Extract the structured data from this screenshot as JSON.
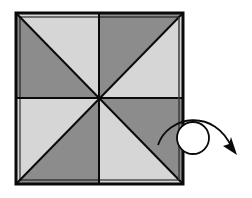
{
  "diagram": {
    "type": "origami-fold-diagram",
    "colors": {
      "background": "#ffffff",
      "light_panel": "#d6d6d6",
      "dark_panel": "#8c8c8c",
      "line": "#0a0a0a"
    },
    "square": {
      "x0": 16,
      "y0": 13,
      "x1": 183,
      "y1": 184,
      "cx": 99,
      "cy": 98
    },
    "triangles": [
      {
        "name": "top-left-lower",
        "shade": "dark"
      },
      {
        "name": "top-left-upper",
        "shade": "light"
      },
      {
        "name": "top-right-upper",
        "shade": "dark"
      },
      {
        "name": "top-right-lower",
        "shade": "light"
      },
      {
        "name": "bottom-left-upper",
        "shade": "light"
      },
      {
        "name": "bottom-left-lower",
        "shade": "dark"
      },
      {
        "name": "bottom-right-upper",
        "shade": "dark"
      },
      {
        "name": "bottom-right-lower",
        "shade": "light"
      }
    ],
    "symbol": {
      "name": "turn-over-symbol",
      "meaning": "turn the model over",
      "circle": {
        "cx": 193,
        "cy": 138,
        "r": 16
      }
    }
  }
}
